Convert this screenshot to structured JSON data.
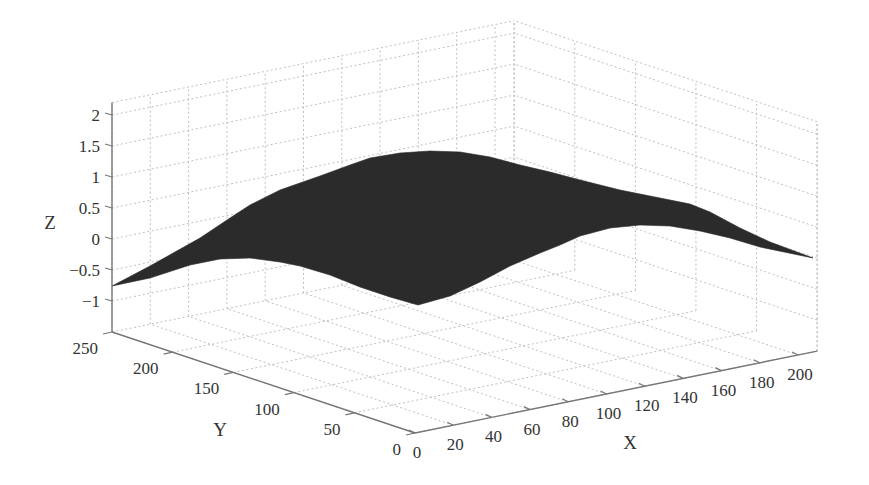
{
  "chart_data": {
    "type": "surface",
    "title": "",
    "xlabel": "X",
    "ylabel": "Y",
    "zlabel": "Z",
    "xlim": [
      0,
      210
    ],
    "ylim": [
      0,
      250
    ],
    "zlim": [
      -1.5,
      2.2
    ],
    "x_ticks": [
      0,
      20,
      40,
      60,
      80,
      100,
      120,
      140,
      160,
      180,
      200
    ],
    "y_ticks": [
      0,
      50,
      100,
      150,
      200,
      250
    ],
    "z_ticks": [
      -1,
      -0.5,
      0,
      0.5,
      1,
      1.5,
      2
    ],
    "x_tick_labels": [
      "0",
      "20",
      "40",
      "60",
      "80",
      "100",
      "120",
      "140",
      "160",
      "180",
      "200"
    ],
    "y_tick_labels": [
      "0",
      "50",
      "100",
      "150",
      "200",
      "250"
    ],
    "z_tick_labels": [
      "−1",
      "−0.5",
      "0",
      "0.5",
      "1",
      "1.5",
      "2"
    ],
    "grid": true,
    "legend": null,
    "surface_color": "#2b2b2b",
    "corner_values": [
      {
        "x": 0,
        "y": 250,
        "z": -0.76
      },
      {
        "x": 0,
        "y": 0,
        "z": 0.56
      },
      {
        "x": 210,
        "y": 0,
        "z": 0.0
      }
    ],
    "peak": {
      "approx_z": 1.45,
      "note": "broad dome near center of domain"
    },
    "surface_outline_px": {
      "top": [
        [
          112,
          286
        ],
        [
          150,
          266
        ],
        [
          200,
          238
        ],
        [
          230,
          218
        ],
        [
          250,
          205
        ],
        [
          280,
          190
        ],
        [
          320,
          176
        ],
        [
          350,
          165
        ],
        [
          370,
          158
        ],
        [
          400,
          153
        ],
        [
          430,
          151
        ],
        [
          460,
          152
        ],
        [
          490,
          157
        ],
        [
          520,
          165
        ],
        [
          550,
          172
        ],
        [
          580,
          180
        ],
        [
          620,
          190
        ],
        [
          660,
          198
        ],
        [
          690,
          204
        ],
        [
          710,
          212
        ],
        [
          740,
          228
        ],
        [
          770,
          242
        ],
        [
          813,
          258
        ]
      ],
      "bottom": [
        [
          813,
          258
        ],
        [
          760,
          247
        ],
        [
          730,
          238
        ],
        [
          700,
          231
        ],
        [
          670,
          226
        ],
        [
          640,
          225
        ],
        [
          610,
          228
        ],
        [
          580,
          236
        ],
        [
          560,
          245
        ],
        [
          540,
          253
        ],
        [
          510,
          266
        ],
        [
          480,
          282
        ],
        [
          450,
          296
        ],
        [
          418,
          305
        ],
        [
          390,
          297
        ],
        [
          360,
          287
        ],
        [
          330,
          275
        ],
        [
          300,
          266
        ],
        [
          280,
          262
        ],
        [
          250,
          258
        ],
        [
          220,
          259
        ],
        [
          190,
          265
        ],
        [
          150,
          278
        ],
        [
          112,
          286
        ]
      ]
    }
  }
}
